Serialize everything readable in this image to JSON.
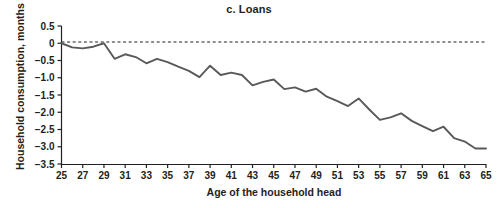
{
  "chart_data": {
    "type": "line",
    "title": "c. Loans",
    "xlabel": "Age of the household head",
    "ylabel": "Household consumption, months",
    "xlim": [
      25,
      65
    ],
    "ylim": [
      -3.5,
      0.5
    ],
    "grid": false,
    "legend": null,
    "zero_reference_line": 0,
    "zero_line_style": "dashed",
    "series_name": "Loans",
    "series_color": "#58595b",
    "x_tick_labels": [
      "25",
      "27",
      "29",
      "31",
      "33",
      "35",
      "37",
      "39",
      "41",
      "43",
      "45",
      "47",
      "49",
      "51",
      "53",
      "55",
      "57",
      "59",
      "61",
      "63",
      "65"
    ],
    "y_tick_labels": [
      "0.5",
      "0",
      "−0.5",
      "−1.0",
      "−1.5",
      "−2.0",
      "−2.5",
      "−3.0",
      "−3.5"
    ],
    "y_tick_values": [
      0.5,
      0,
      -0.5,
      -1.0,
      -1.5,
      -2.0,
      -2.5,
      -3.0,
      -3.5
    ],
    "x": [
      25,
      26,
      27,
      28,
      29,
      30,
      31,
      32,
      33,
      34,
      35,
      36,
      37,
      38,
      39,
      40,
      41,
      42,
      43,
      44,
      45,
      46,
      47,
      48,
      49,
      50,
      51,
      52,
      53,
      54,
      55,
      56,
      57,
      58,
      59,
      60,
      61,
      62,
      63,
      64,
      65
    ],
    "values": [
      0.0,
      -0.12,
      -0.15,
      -0.1,
      0.0,
      -0.45,
      -0.32,
      -0.4,
      -0.58,
      -0.45,
      -0.55,
      -0.68,
      -0.8,
      -0.98,
      -0.65,
      -0.92,
      -0.85,
      -0.92,
      -1.22,
      -1.12,
      -1.05,
      -1.33,
      -1.28,
      -1.4,
      -1.32,
      -1.55,
      -1.68,
      -1.82,
      -1.6,
      -1.92,
      -2.22,
      -2.15,
      -2.03,
      -2.25,
      -2.4,
      -2.55,
      -2.42,
      -2.75,
      -2.85,
      -3.05,
      -3.05
    ]
  },
  "axis": {
    "title_text": "c. Loans",
    "x_title": "Age of the household head",
    "y_title": "Household consumption, months"
  }
}
